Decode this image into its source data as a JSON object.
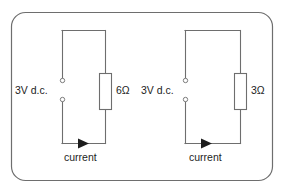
{
  "figure": {
    "border_color": "#6e6e6e",
    "wire_color": "#6e6e6e",
    "text_color": "#1d1d1d",
    "background": "#ffffff"
  },
  "circuits": [
    {
      "id": "left-circuit",
      "supply_label": "3V d.c.",
      "resistor_label": "6Ω",
      "current_label": "current",
      "terminal_count": 2,
      "current_direction": "right"
    },
    {
      "id": "right-circuit",
      "supply_label": "3V d.c.",
      "resistor_label": "3Ω",
      "current_label": "current",
      "terminal_count": 2,
      "current_direction": "right"
    }
  ]
}
